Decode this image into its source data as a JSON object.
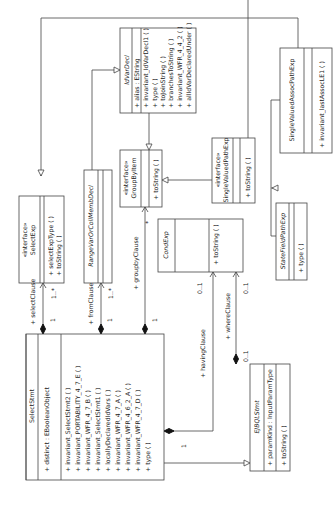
{
  "diagram": {
    "type": "uml-class-diagram",
    "orientation": "rotated-90-ccw",
    "classes": [
      {
        "id": "SelectStmt",
        "name": "SelectStmt",
        "stereotype": "",
        "abstract": false,
        "attributes": [
          "+ distinct : EBooleanObject"
        ],
        "operations": [
          "+ invariant_SelectStmt2 ( )",
          "+ invariant_PORTABILITY_4_7_E ( )",
          "+ invariant_WFR_4_7_B ( )",
          "+ invariant_SelectStmt1 ( )",
          "+ locallyDeclaredIdVars ( )",
          "+ invariant_WFR_4_7_A ( )",
          "+ invariant_WFR_4_6_2_A ( )",
          "+ invariant_WFR_4_7_D ( )",
          "+ type ( )"
        ]
      },
      {
        "id": "SelectExp",
        "name": "SelectExp",
        "stereotype": "«interface»",
        "abstract": false,
        "attributes": [],
        "operations": [
          "+ selectExpType ( )",
          "+ toString ( )"
        ]
      },
      {
        "id": "RangeVarOrCollMembDecl",
        "name": "RangeVarOrCollMembDecl",
        "stereotype": "",
        "abstract": true,
        "attributes": [],
        "operations": []
      },
      {
        "id": "GroupByItem",
        "name": "GroupByItem",
        "stereotype": "«interface»",
        "abstract": false,
        "attributes": [],
        "operations": [
          "+ toString ( )"
        ]
      },
      {
        "id": "CondExp",
        "name": "CondExp",
        "stereotype": "",
        "abstract": true,
        "attributes": [],
        "operations": [
          "+ toString ( )"
        ]
      },
      {
        "id": "EJBQLStmt",
        "name": "EJBQLStmt",
        "stereotype": "",
        "abstract": true,
        "attributes": [
          "+ paramKind : InputParamType"
        ],
        "operations": [
          "+ toString ( )"
        ]
      },
      {
        "id": "IdVarDecl",
        "name": "IdVarDecl",
        "stereotype": "",
        "abstract": true,
        "attributes": [
          "+ alias : EString"
        ],
        "operations": [
          "+ invariant_IdVarDecl1 ( )",
          "+ type ( )",
          "+ toJoinString ( )",
          "+ branchesToString ( )",
          "+ invariant_WFR_4_4_2 ( )",
          "+ allIdVarDeclaredUnder ( )"
        ]
      },
      {
        "id": "SingleValuedPathExp",
        "name": "SingleValuedPathExp",
        "stereotype": "«interface»",
        "abstract": false,
        "attributes": [],
        "operations": [
          "+ toString ( )"
        ]
      },
      {
        "id": "SingleValuedAssocPathExp",
        "name": "SingleValuedAssocPathExp",
        "stereotype": "",
        "abstract": false,
        "attributes": [],
        "operations": [
          "+ invariant_lastAssocLE1 ( )"
        ]
      },
      {
        "id": "StateFieldPathExp",
        "name": "StateFieldPathExp",
        "stereotype": "",
        "abstract": true,
        "attributes": [],
        "operations": [
          "+ type ( )"
        ]
      }
    ],
    "associations": [
      {
        "from": "SelectStmt",
        "to": "SelectExp",
        "role": "+ selectClause",
        "source_mult": "1",
        "target_mult": "1..*",
        "kind": "composition"
      },
      {
        "from": "SelectStmt",
        "to": "RangeVarOrCollMembDecl",
        "role": "+ fromClause",
        "source_mult": "1",
        "target_mult": "1..*",
        "kind": "composition"
      },
      {
        "from": "SelectStmt",
        "to": "GroupByItem",
        "role": "+ groupbyClause",
        "source_mult": "1",
        "target_mult": "*",
        "kind": "composition"
      },
      {
        "from": "SelectStmt",
        "to": "CondExp",
        "role": "+ havingClause",
        "source_mult": "1",
        "target_mult": "0..1",
        "kind": "composition"
      },
      {
        "from": "EJBQLStmt",
        "to": "CondExp",
        "role": "+ whereClause",
        "source_mult": "0..1",
        "target_mult": "0..1",
        "kind": "composition"
      }
    ],
    "generalizations": [
      {
        "child": "SelectStmt",
        "parent": "EJBQLStmt"
      },
      {
        "child": "IdVarDecl",
        "parent": "SelectExp"
      },
      {
        "child": "RangeVarOrCollMembDecl",
        "parent": "IdVarDecl"
      },
      {
        "child": "IdVarDecl",
        "parent": "GroupByItem"
      },
      {
        "child": "SingleValuedPathExp",
        "parent": "GroupByItem"
      },
      {
        "child": "SingleValuedAssocPathExp",
        "parent": "SingleValuedPathExp"
      },
      {
        "child": "StateFieldPathExp",
        "parent": "SingleValuedPathExp"
      }
    ]
  },
  "labels": {
    "selectStmt_name": "SelectStmt",
    "selectStmt_attr": "+ distinct : EBooleanObject",
    "selectStmt_ops": [
      "+ invariant_SelectStmt2 ( )",
      "+ invariant_PORTABILITY_4_7_E ( )",
      "+ invariant_WFR_4_7_B ( )",
      "+ invariant_SelectStmt1 ( )",
      "+ locallyDeclaredIdVars ( )",
      "+ invariant_WFR_4_7_A ( )",
      "+ invariant_WFR_4_6_2_A ( )",
      "+ invariant_WFR_4_7_D ( )",
      "+ type ( )"
    ],
    "selectExp_stereo": "«interface»",
    "selectExp_name": "SelectExp",
    "selectExp_ops": [
      "+ selectExpType ( )",
      "+ toString ( )"
    ],
    "rangeVar_name": "RangeVarOrCollMembDecl",
    "groupBy_stereo": "«interface»",
    "groupBy_name": "GroupByItem",
    "groupBy_ops": [
      "+ toString ( )"
    ],
    "condExp_name": "CondExp",
    "condExp_ops": [
      "+ toString ( )"
    ],
    "ejbql_name": "EJBQLStmt",
    "ejbql_attr": "+ paramKind : InputParamType",
    "ejbql_ops": [
      "+ toString ( )"
    ],
    "idVar_name": "IdVarDecl",
    "idVar_attr": "+ alias : EString",
    "idVar_ops": [
      "+ invariant_IdVarDecl1 ( )",
      "+ type ( )",
      "+ toJoinString ( )",
      "+ branchesToString ( )",
      "+ invariant_WFR_4_4_2 ( )",
      "+ allIdVarDeclaredUnder ( )"
    ],
    "svp_stereo": "«interface»",
    "svp_name": "SingleValuedPathExp",
    "svp_ops": [
      "+ toString ( )"
    ],
    "svap_name": "SingleValuedAssocPathExp",
    "svap_ops": [
      "+ invariant_lastAssocLE1 ( )"
    ],
    "sfp_name": "StateFieldPathExp",
    "sfp_ops": [
      "+ type ( )"
    ],
    "role_select": "+ selectClause",
    "role_from": "+ fromClause",
    "role_groupby": "+ groupbyClause",
    "role_having": "+ havingClause",
    "role_where": "+ whereClause",
    "m_one": "1",
    "m_onemany": "1..*",
    "m_star": "*",
    "m_zeroone": "0..1"
  }
}
